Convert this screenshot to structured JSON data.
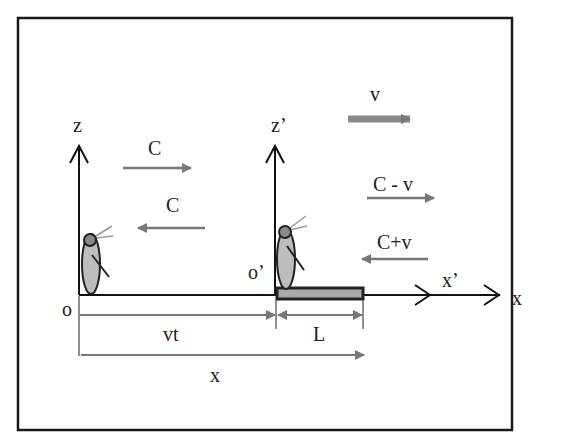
{
  "diagram": {
    "type": "relativity-frames",
    "colors": {
      "frame": "#1a1a1a",
      "axis": "#111111",
      "arrow_gray": "#777777",
      "body": "#bdbdbd",
      "head": "#8a8a8a",
      "rod": "#333333"
    },
    "labels": {
      "z": "z",
      "z_prime": "z’",
      "o": "o",
      "o_prime": "o’",
      "x": "x",
      "x_prime": "x’",
      "v": "v",
      "c_right": "C",
      "c_left": "C",
      "c_minus_v": "C - v",
      "c_plus_v": "C+v",
      "vt": "vt",
      "L": "L",
      "x_distance": "x"
    }
  }
}
